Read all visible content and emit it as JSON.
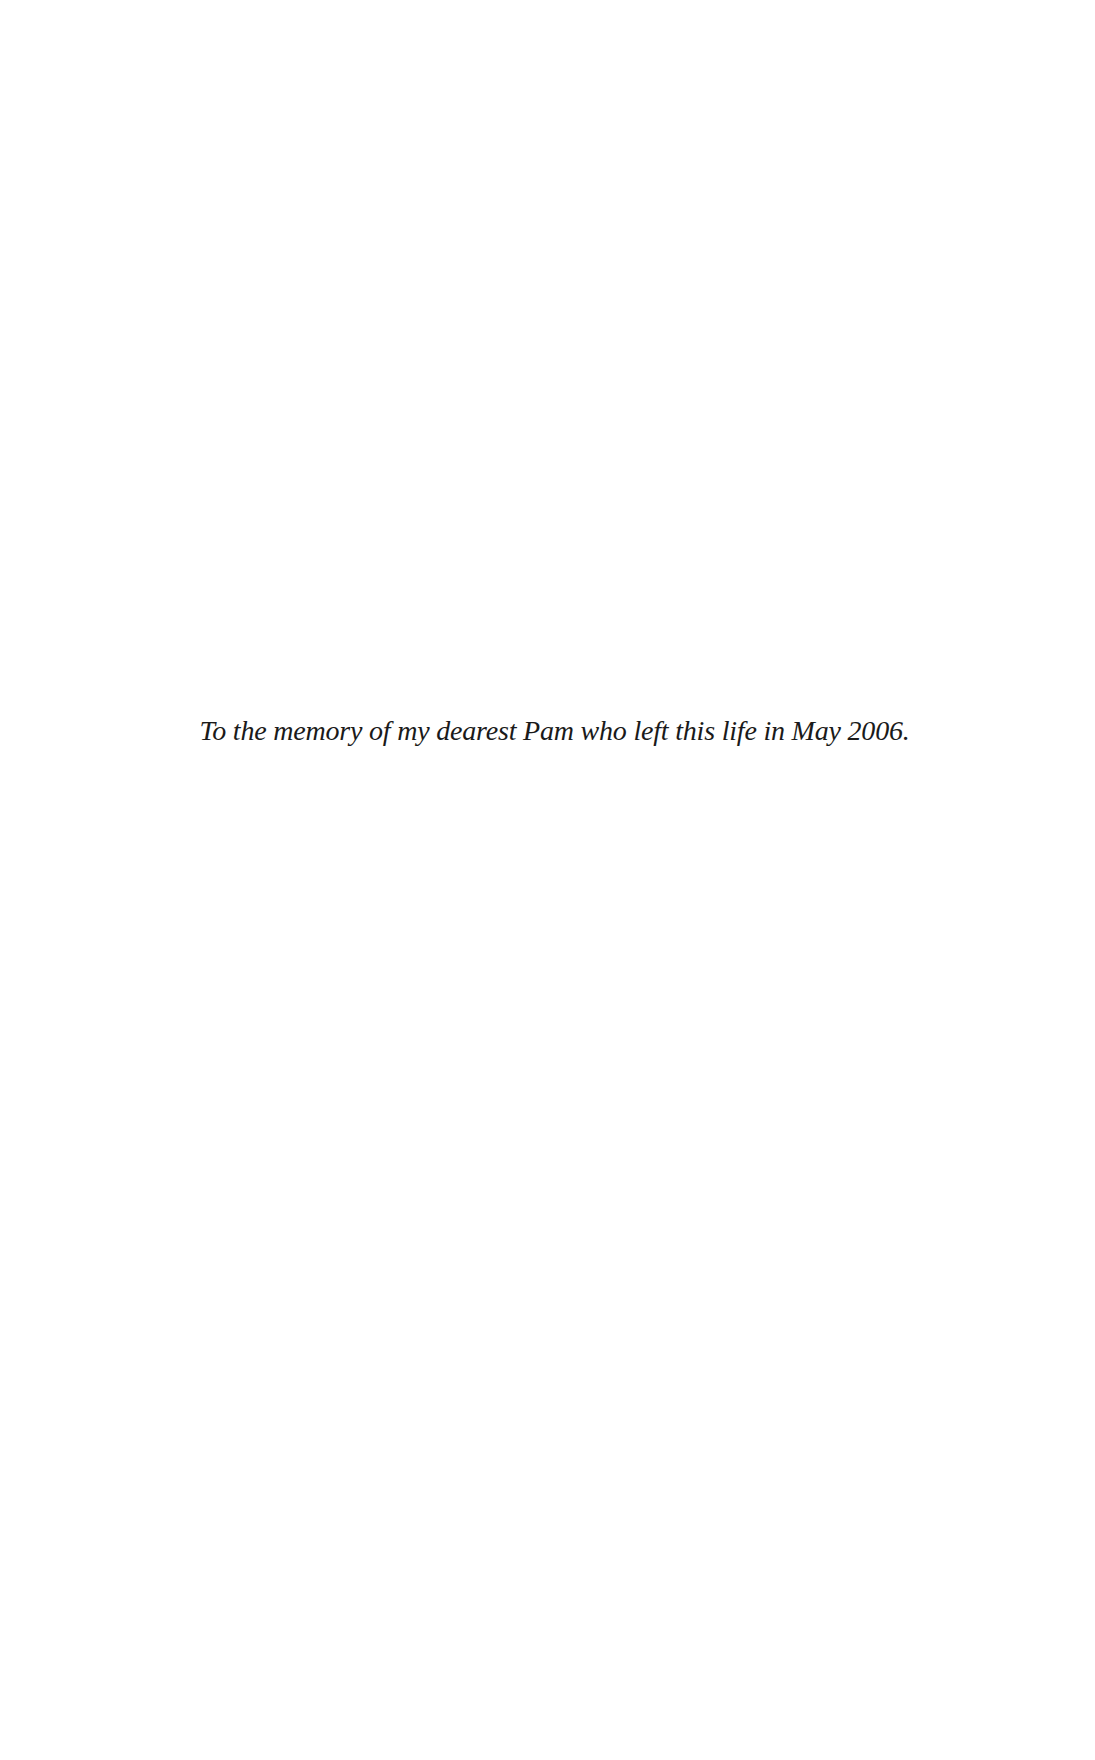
{
  "page": {
    "type": "dedication",
    "dedication_text": "To the memory of my dearest Pam who left this life in May 2006."
  }
}
